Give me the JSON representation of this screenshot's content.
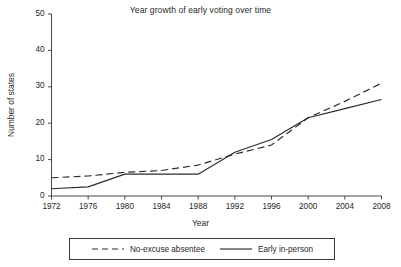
{
  "chart_data": {
    "type": "line",
    "title": "Year growth of early voting over time",
    "xlabel": "Year",
    "ylabel": "Number of states",
    "grid": false,
    "legend_position": "bottom",
    "x": [
      1972,
      1976,
      1980,
      1984,
      1988,
      1992,
      1996,
      2000,
      2004,
      2008
    ],
    "xtick_labels": [
      "1972",
      "1976",
      "1980",
      "1984",
      "1988",
      "1992",
      "1996",
      "2000",
      "2004",
      "2008"
    ],
    "ytick_labels": [
      "0",
      "10",
      "20",
      "30",
      "40",
      "50"
    ],
    "yticks": [
      0,
      10,
      20,
      30,
      40,
      50
    ],
    "xlim": [
      1972,
      2008
    ],
    "ylim": [
      0,
      50
    ],
    "series": [
      {
        "name": "No-excuse absentee",
        "style": "dashed",
        "color": "#2b2b2b",
        "values": [
          5,
          5.5,
          6.5,
          7,
          8.5,
          11.5,
          14,
          21.5,
          26,
          31
        ]
      },
      {
        "name": "Early in-person",
        "style": "solid",
        "color": "#2b2b2b",
        "values": [
          2,
          2.5,
          6,
          6,
          6,
          12,
          15.5,
          21.5,
          24,
          26.5
        ]
      }
    ]
  },
  "legend": {
    "entries": [
      {
        "label": "No-excuse absentee",
        "style": "dashed"
      },
      {
        "label": "Early in-person",
        "style": "solid"
      }
    ]
  }
}
